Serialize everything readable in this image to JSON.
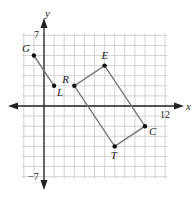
{
  "diagram": {
    "type": "coordinate-plane",
    "axes": {
      "x_label": "x",
      "y_label": "y",
      "x_range": [
        -2,
        12
      ],
      "y_range": [
        -7,
        7
      ],
      "x_tick_label": "12",
      "y_top_tick_label": "7",
      "y_bottom_tick_label": "−7"
    },
    "segments": [
      {
        "name": "GL",
        "from": "G",
        "to": "L"
      }
    ],
    "polygons": [
      {
        "name": "RECT",
        "vertices": [
          "R",
          "E",
          "C",
          "T"
        ]
      }
    ],
    "points": [
      {
        "label": "G",
        "x": -1,
        "y": 5
      },
      {
        "label": "L",
        "x": 1,
        "y": 2
      },
      {
        "label": "R",
        "x": 3,
        "y": 2
      },
      {
        "label": "E",
        "x": 6,
        "y": 4
      },
      {
        "label": "C",
        "x": 10,
        "y": -2
      },
      {
        "label": "T",
        "x": 7,
        "y": -4
      }
    ],
    "colors": {
      "grid": "#c8c8c8",
      "axis": "#222222",
      "segment": "#777777",
      "point": "#111111"
    }
  }
}
